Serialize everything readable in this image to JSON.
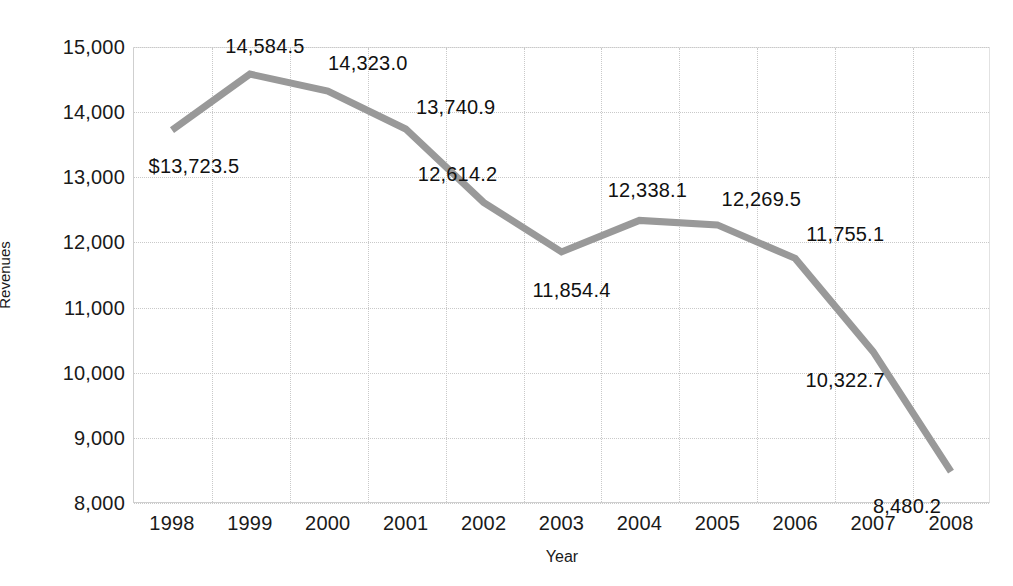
{
  "chart_data": {
    "type": "line",
    "title": "",
    "xlabel": "Year",
    "ylabel": "Revenues",
    "categories": [
      "1998",
      "1999",
      "2000",
      "2001",
      "2002",
      "2003",
      "2004",
      "2005",
      "2006",
      "2007",
      "2008"
    ],
    "values": [
      13723.5,
      14584.5,
      14323.0,
      13740.9,
      12614.2,
      11854.4,
      12338.1,
      12269.5,
      11755.1,
      10322.7,
      8480.2
    ],
    "point_labels": [
      "$13,723.5",
      "14,584.5",
      "14,323.0",
      "13,740.9",
      "12,614.2",
      "11,854.4",
      "12,338.1",
      "12,269.5",
      "11,755.1",
      "10,322.7",
      "8,480.2"
    ],
    "ylim": [
      8000,
      15000
    ],
    "ytick_values": [
      15000,
      14000,
      13000,
      12000,
      11000,
      10000,
      9000,
      8000
    ],
    "ytick_labels": [
      "15,000",
      "14,000",
      "13,000",
      "12,000",
      "11,000",
      "10,000",
      "9,000",
      "8,000"
    ],
    "grid": true,
    "legend": false,
    "series_color": "#999999",
    "grid_color": "#c9c9c9",
    "text_color": "#1a1a1a",
    "background": "#ffffff",
    "line_width": 7,
    "markers": false
  },
  "axes": {
    "y_title": "Revenues",
    "x_title": "Year"
  }
}
